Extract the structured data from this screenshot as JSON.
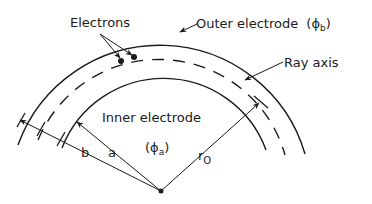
{
  "diagram": {
    "type": "cross-section of cylindrical electrostatic analyzer",
    "labels": {
      "electrons": "Electrons",
      "outer_electrode": "Outer electrode",
      "outer_potential": "(ϕ",
      "outer_potential_sub": "b",
      "outer_potential_close": ")",
      "ray_axis": "Ray axis",
      "inner_electrode": "Inner electrode",
      "inner_potential": "(ϕ",
      "inner_potential_sub": "a",
      "inner_potential_close": ")",
      "radius_b": "b",
      "radius_a": "a",
      "radius_r0": "r",
      "radius_r0_sub": "O"
    },
    "elements": [
      {
        "name": "outer-electrode-arc",
        "style": "solid",
        "radius": "b"
      },
      {
        "name": "ray-axis-arc",
        "style": "dashed",
        "radius": "r0"
      },
      {
        "name": "inner-electrode-arc",
        "style": "solid",
        "radius": "a"
      },
      {
        "name": "center-point",
        "style": "dot"
      }
    ],
    "colors": {
      "ink": "#1a1a1a",
      "background": "#ffffff"
    }
  }
}
